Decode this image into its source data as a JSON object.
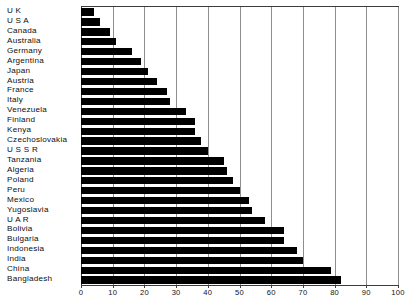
{
  "chart_data": {
    "type": "bar",
    "orientation": "horizontal",
    "title": "",
    "subtitle": "",
    "xlabel": "",
    "ylabel": "",
    "xlim": [
      0,
      100
    ],
    "grid": true,
    "legend": null,
    "xticks": [
      0,
      10,
      20,
      30,
      40,
      50,
      60,
      70,
      80,
      90,
      100
    ],
    "xtick_labels": [
      "0",
      "10",
      "20",
      "30",
      "40",
      "50",
      "60",
      "70",
      "80",
      "90",
      "100"
    ],
    "categories": [
      "U K",
      "U S A",
      "Canada",
      "Australia",
      "Germany",
      "Argentina",
      "Japan",
      "Austria",
      "France",
      "Italy",
      "Venezuela",
      "Finland",
      "Kenya",
      "Czechoslovakia",
      "U S S R",
      "Tanzania",
      "Algeria",
      "Poland",
      "Peru",
      "Mexico",
      "Yugoslavia",
      "U A R",
      "Bolivia",
      "Bulgaria",
      "Indonesia",
      "India",
      "China",
      "Bangladesh"
    ],
    "values": [
      4,
      6,
      9,
      11,
      16,
      19,
      21,
      24,
      27,
      28,
      33,
      36,
      36,
      38,
      40,
      45,
      46,
      48,
      50,
      53,
      54,
      58,
      64,
      64,
      68,
      70,
      79,
      82
    ]
  },
  "colors": {
    "bar": "#000000",
    "gridline": "#8e8e8e",
    "axis": "#3c3c3c",
    "background": "#ffffff",
    "text": "#111111"
  },
  "caption_remnant": "",
  "axis": {
    "value_axis_name": "value-axis",
    "category_axis_name": "category-axis"
  }
}
